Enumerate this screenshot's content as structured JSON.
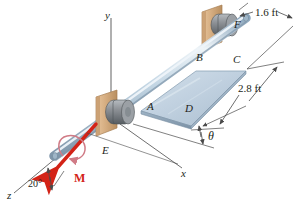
{
  "figure": {
    "background_color": "#ffffff"
  },
  "axes": [
    {
      "name": "y-axis",
      "label": "y"
    },
    {
      "name": "x-axis",
      "label": "x"
    },
    {
      "name": "z-axis",
      "label": "z"
    }
  ],
  "points": [
    {
      "name": "point-a",
      "label": "A"
    },
    {
      "name": "point-b",
      "label": "B"
    },
    {
      "name": "point-c",
      "label": "C"
    },
    {
      "name": "point-d",
      "label": "D"
    },
    {
      "name": "point-e",
      "label": "E"
    },
    {
      "name": "point-f",
      "label": "F"
    }
  ],
  "dimensions": [
    {
      "name": "dimension-plate-width",
      "label": "1.6 ft"
    },
    {
      "name": "dimension-plate-length",
      "label": "2.8 ft"
    }
  ],
  "angles": [
    {
      "name": "angle-theta",
      "label": "θ"
    },
    {
      "name": "angle-z-axis",
      "label": "20°"
    }
  ],
  "loads": [
    {
      "name": "moment-vector",
      "label": "M",
      "color": "#d32317"
    }
  ],
  "colors": {
    "shaft": "#b9ccdd",
    "shaft_highlight": "#e8f0f6",
    "shaft_shadow": "#7e97ad",
    "plate_face": "#c3d2e0",
    "plate_edge": "#8ea4b8",
    "bearing_wood": "#d8b084",
    "bearing_wood_dark": "#b58a5c",
    "bearing_collar": "#8d9196",
    "bearing_collar_dark": "#5e6469",
    "moment_red": "#d32317",
    "line": "#4a4a4a",
    "text": "#231f20"
  },
  "caption": {
    "text": ""
  }
}
